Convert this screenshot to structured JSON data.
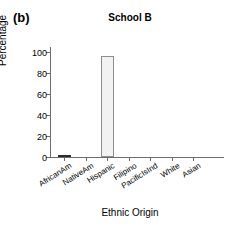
{
  "figure": {
    "panel_label": "(b)",
    "title": "School B",
    "xlabel": "Ethnic Origin",
    "ylabel": "Percentage"
  },
  "axis": {
    "yticks": [
      0,
      20,
      40,
      60,
      80,
      100
    ],
    "ytick_labels": [
      "0",
      "20",
      "40",
      "60",
      "80",
      "100"
    ],
    "ymin": 0,
    "ymax": 105
  },
  "colors": {
    "bar_fill": "#f2f2f2",
    "bar_edge": "#8d8d8d",
    "axis": "#6b6b6b",
    "text": "#000000",
    "background": "#ffffff"
  },
  "chart_data": {
    "type": "bar",
    "title": "School B",
    "xlabel": "Ethnic Origin",
    "ylabel": "Percentage",
    "categories": [
      "AfricanAm",
      "NativeAm",
      "Hispanic",
      "Filipino",
      "PacificIsInd",
      "White",
      "Asian"
    ],
    "values": [
      1,
      0,
      96,
      0,
      0,
      0,
      0
    ],
    "ylim": [
      0,
      105
    ],
    "yticks": [
      0,
      20,
      40,
      60,
      80,
      100
    ],
    "grid": false,
    "legend": false,
    "panel_label": "(b)"
  }
}
